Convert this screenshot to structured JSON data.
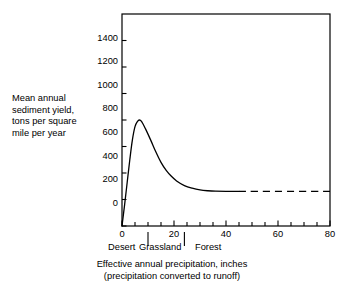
{
  "chart_data": {
    "type": "line",
    "title": "",
    "subtitle": "",
    "xlabel_line1": "Effective annual precipitation, inches",
    "xlabel_line2": "(precipitation converted to runoff)",
    "ylabel_lines": [
      "Mean annual",
      "sediment yield,",
      "tons per square",
      "mile per year"
    ],
    "xlim": [
      0,
      80
    ],
    "ylim": [
      0,
      1600
    ],
    "x_ticks_major": [
      0,
      20,
      40,
      60,
      80
    ],
    "x_tick_labels": [
      "0",
      "20",
      "40",
      "60",
      "80"
    ],
    "x_ticks_minor_step": 5,
    "y_ticks_major": [
      0,
      200,
      400,
      600,
      800,
      1000,
      1200,
      1400
    ],
    "y_tick_labels": [
      "0",
      "200",
      "400",
      "600",
      "800",
      "1000",
      "1200",
      "1400"
    ],
    "grid": false,
    "legend": false,
    "zone_boundaries": [
      10,
      24
    ],
    "zones": [
      {
        "label": "Desert",
        "center": 5
      },
      {
        "label": "Grassland",
        "center": 17
      },
      {
        "label": "Forest",
        "center": 35
      }
    ],
    "series": [
      {
        "name": "sediment yield",
        "style": "solid",
        "points": [
          [
            0,
            0
          ],
          [
            1,
            160
          ],
          [
            2,
            330
          ],
          [
            3,
            500
          ],
          [
            4,
            650
          ],
          [
            5,
            750
          ],
          [
            6,
            790
          ],
          [
            6.6,
            800
          ],
          [
            7.5,
            790
          ],
          [
            9,
            735
          ],
          [
            11,
            650
          ],
          [
            13,
            560
          ],
          [
            15,
            480
          ],
          [
            17,
            420
          ],
          [
            19,
            375
          ],
          [
            21,
            340
          ],
          [
            24,
            305
          ],
          [
            27,
            285
          ],
          [
            30,
            272
          ],
          [
            33,
            266
          ],
          [
            36,
            263
          ],
          [
            40,
            262
          ],
          [
            45,
            262
          ]
        ]
      },
      {
        "name": "sediment yield extrapolated",
        "style": "dashed",
        "points": [
          [
            45,
            262
          ],
          [
            80,
            262
          ]
        ]
      }
    ],
    "peak": {
      "x": 6.6,
      "y": 800
    },
    "plateau_value": 262,
    "colors": {
      "line": "#000000",
      "axis": "#000000",
      "background": "#ffffff"
    }
  },
  "ticks": {
    "y": [
      {
        "label": "1400",
        "top": 33.5
      },
      {
        "label": "1200",
        "top": 57.2
      },
      {
        "label": "1000",
        "top": 80.8
      },
      {
        "label": "800",
        "top": 104.4
      },
      {
        "label": "600",
        "top": 128.1
      },
      {
        "label": "400",
        "top": 151.7
      },
      {
        "label": "200",
        "top": 175.4
      },
      {
        "label": "0",
        "top": 199.0
      }
    ],
    "x": [
      {
        "label": "0",
        "left": 108.0
      },
      {
        "label": "20",
        "left": 160.0
      },
      {
        "label": "40",
        "left": 212.0
      },
      {
        "label": "60",
        "left": 264.0
      },
      {
        "label": "80",
        "left": 316.0
      }
    ]
  },
  "zones": [
    {
      "label": "Desert",
      "left": 108.0
    },
    {
      "label": "Grassland",
      "left": 139.0
    },
    {
      "label": "Forest",
      "left": 195.0
    }
  ]
}
